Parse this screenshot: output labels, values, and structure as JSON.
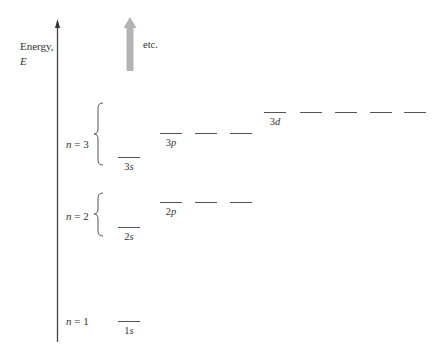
{
  "axis": {
    "label_line1": "Energy,",
    "label_line2": "E"
  },
  "arrow_note": "etc.",
  "shells": [
    {
      "label": "n = 1"
    },
    {
      "label": "n = 2"
    },
    {
      "label": "n = 3"
    }
  ],
  "subshells": [
    {
      "name": "1s",
      "label_num": "1",
      "label_letter": "s",
      "orbitals": 1
    },
    {
      "name": "2s",
      "label_num": "2",
      "label_letter": "s",
      "orbitals": 1
    },
    {
      "name": "2p",
      "label_num": "2",
      "label_letter": "p",
      "orbitals": 3
    },
    {
      "name": "3s",
      "label_num": "3",
      "label_letter": "s",
      "orbitals": 1
    },
    {
      "name": "3p",
      "label_num": "3",
      "label_letter": "p",
      "orbitals": 3
    },
    {
      "name": "3d",
      "label_num": "3",
      "label_letter": "d",
      "orbitals": 5
    }
  ],
  "colors": {
    "axis": "#444444",
    "level": "#555555",
    "arrow": "#b3b3b3"
  }
}
